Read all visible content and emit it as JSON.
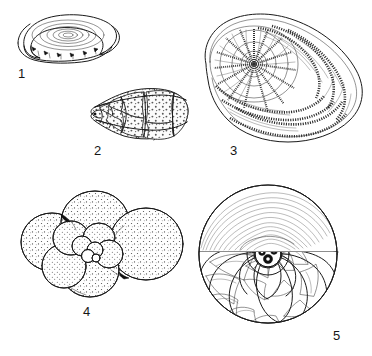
{
  "plate": {
    "title": "Foraminifera shell morphology plate",
    "description": "Black-and-white scientific line drawings of five foraminiferal tests, each numbered.",
    "background_color": "#ffffff",
    "ink_color": "#1a1a1a",
    "width": 372,
    "height": 356
  },
  "figures": [
    {
      "number": "1",
      "name": "milioline-coiled-test",
      "caption_label": "1",
      "description": "Milioline test: flattened oval shell with concentric elongate chambers coiled in planes, viewed obliquely with an apertural flange at lower left.",
      "label_x": 18,
      "label_y": 67,
      "drawing_x": 8,
      "drawing_y": 6,
      "drawing_w": 116,
      "drawing_h": 58,
      "surface": "smooth",
      "chamber_count": 7
    },
    {
      "number": "2",
      "name": "conical-trochospiral-test",
      "caption_label": "2",
      "description": "Conical trochospiral test: chambers increasing in size toward the aperture, surface densely perforated with coarse pores.",
      "label_x": 94,
      "label_y": 144,
      "drawing_x": 84,
      "drawing_y": 84,
      "drawing_w": 106,
      "drawing_h": 58,
      "surface": "perforate",
      "chamber_count": 11
    },
    {
      "number": "3",
      "name": "planispiral-beaded-test",
      "caption_label": "3",
      "description": "Large planispiral evolute test with radiating beaded septal ribs spreading from a small central spiral umbo; final whorl chambers broad and arched.",
      "label_x": 230,
      "label_y": 144,
      "drawing_x": 196,
      "drawing_y": 8,
      "drawing_w": 170,
      "drawing_h": 140,
      "surface": "beaded-ribs",
      "chamber_count": 16
    },
    {
      "number": "4",
      "name": "globigerinid-test",
      "caption_label": "4",
      "description": "Globigerinid test: inflated globular chambers in a low trochospiral, each chamber covered by fine scattered pores.",
      "label_x": 83,
      "label_y": 305,
      "drawing_x": 16,
      "drawing_y": 186,
      "drawing_w": 172,
      "drawing_h": 116,
      "surface": "finely-perforate",
      "chamber_count": 11
    },
    {
      "number": "5",
      "name": "sectioned-involute-test",
      "caption_label": "5",
      "description": "Involute discoidal test shown half-sectioned: upper half intact with fine growth striae, lower half cut away to reveal the chamber spiral and dark central proloculus.",
      "label_x": 333,
      "label_y": 329,
      "drawing_x": 188,
      "drawing_y": 186,
      "drawing_w": 160,
      "drawing_h": 142,
      "surface": "striate-sectioned",
      "chamber_count": 18
    }
  ]
}
